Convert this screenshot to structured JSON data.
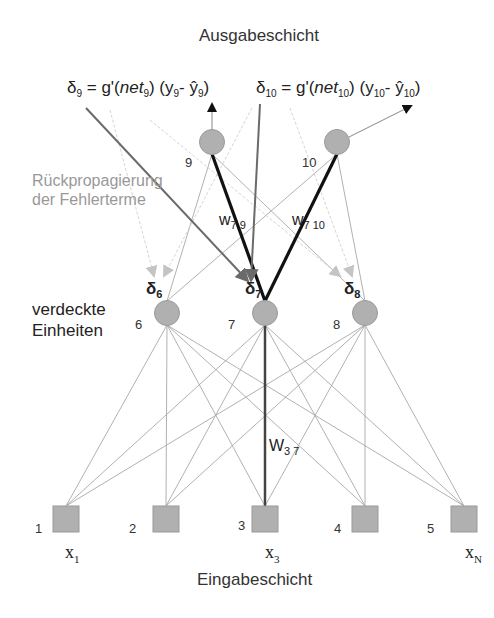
{
  "diagram": {
    "type": "neural-network-backpropagation",
    "title_top": "Ausgabeschicht",
    "title_bottom": "Eingabeschicht",
    "backprop_label_line1": "Rückpropagierung",
    "backprop_label_line2": "der Fehlerterme",
    "hidden_label_line1": "verdeckte",
    "hidden_label_line2": "Einheiten",
    "formula_9": {
      "delta": "δ",
      "delta_sub": "9",
      "eq": " = g'(",
      "net": "net",
      "net_sub": "9",
      "mid": ") (y",
      "y_sub": "9",
      "minus": "- ŷ",
      "yhat_sub": "9",
      "close": ")"
    },
    "formula_10": {
      "delta": "δ",
      "delta_sub": "10",
      "eq": " = g'(",
      "net": "net",
      "net_sub": "10",
      "mid": ") (y",
      "y_sub": "10",
      "minus": "- ŷ",
      "yhat_sub": "10",
      "close": ")"
    },
    "output_nodes": [
      {
        "id": "9",
        "label": "9"
      },
      {
        "id": "10",
        "label": "10"
      }
    ],
    "hidden_nodes": [
      {
        "id": "6",
        "label": "6",
        "delta": "δ",
        "delta_sub": "6"
      },
      {
        "id": "7",
        "label": "7",
        "delta": "δ",
        "delta_sub": "7"
      },
      {
        "id": "8",
        "label": "8",
        "delta": "δ",
        "delta_sub": "8"
      }
    ],
    "input_nodes": [
      {
        "id": "1",
        "label": "1",
        "x": "x",
        "x_sub": "1"
      },
      {
        "id": "2",
        "label": "2"
      },
      {
        "id": "3",
        "label": "3",
        "x": "x",
        "x_sub": "3"
      },
      {
        "id": "4",
        "label": "4"
      },
      {
        "id": "5",
        "label": "5",
        "x": "x",
        "x_sub": "N"
      }
    ],
    "weights": {
      "w79": {
        "w": "w",
        "sub": "7 9"
      },
      "w710": {
        "w": "w",
        "sub": "7 10"
      },
      "w37": {
        "w": "W",
        "sub": "3 7"
      }
    },
    "colors": {
      "node_fill": "#b0b0b0",
      "node_stroke": "#9a9a9a",
      "thin_line": "#a8a8a8",
      "bold_line": "#111111",
      "backprop_arrow": "#6a6a6a",
      "faint_arrow": "#d0d0d0",
      "label_gray": "#999999"
    }
  }
}
